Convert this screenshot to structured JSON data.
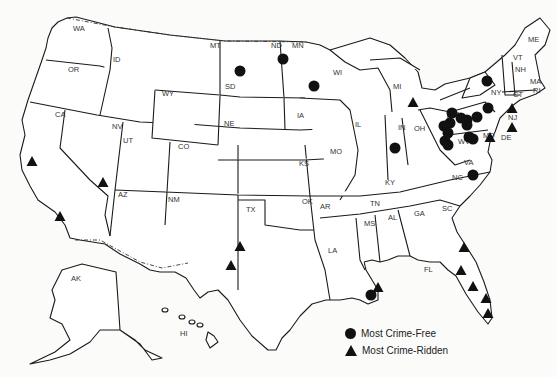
{
  "map": {
    "title": "",
    "state_labels": [
      {
        "code": "WA",
        "x": 73,
        "y": 31
      },
      {
        "code": "OR",
        "x": 68,
        "y": 72
      },
      {
        "code": "ID",
        "x": 113,
        "y": 62
      },
      {
        "code": "MT",
        "x": 210,
        "y": 48
      },
      {
        "code": "ND",
        "x": 271,
        "y": 48
      },
      {
        "code": "MN",
        "x": 292,
        "y": 48
      },
      {
        "code": "SD",
        "x": 225,
        "y": 89
      },
      {
        "code": "WY",
        "x": 162,
        "y": 96
      },
      {
        "code": "NE",
        "x": 224,
        "y": 126
      },
      {
        "code": "IA",
        "x": 297,
        "y": 118
      },
      {
        "code": "WI",
        "x": 333,
        "y": 75
      },
      {
        "code": "MI",
        "x": 393,
        "y": 89
      },
      {
        "code": "IL",
        "x": 355,
        "y": 127
      },
      {
        "code": "IN",
        "x": 398,
        "y": 130
      },
      {
        "code": "OH",
        "x": 414,
        "y": 131
      },
      {
        "code": "NY",
        "x": 491,
        "y": 95
      },
      {
        "code": "PA",
        "x": 451,
        "y": 117
      },
      {
        "code": "NJ",
        "x": 508,
        "y": 120
      },
      {
        "code": "MD",
        "x": 483,
        "y": 138
      },
      {
        "code": "DE",
        "x": 501,
        "y": 140
      },
      {
        "code": "WV",
        "x": 458,
        "y": 144
      },
      {
        "code": "VA",
        "x": 464,
        "y": 165
      },
      {
        "code": "KY",
        "x": 385,
        "y": 185
      },
      {
        "code": "NC",
        "x": 452,
        "y": 180
      },
      {
        "code": "VT",
        "x": 513,
        "y": 60
      },
      {
        "code": "NH",
        "x": 515,
        "y": 72
      },
      {
        "code": "ME",
        "x": 528,
        "y": 42
      },
      {
        "code": "MA",
        "x": 530,
        "y": 84
      },
      {
        "code": "CT",
        "x": 513,
        "y": 97
      },
      {
        "code": "RI",
        "x": 533,
        "y": 93
      },
      {
        "code": "CA",
        "x": 55,
        "y": 117
      },
      {
        "code": "NV",
        "x": 112,
        "y": 129
      },
      {
        "code": "UT",
        "x": 123,
        "y": 143
      },
      {
        "code": "CO",
        "x": 178,
        "y": 149
      },
      {
        "code": "KS",
        "x": 299,
        "y": 166
      },
      {
        "code": "MO",
        "x": 330,
        "y": 154
      },
      {
        "code": "AZ",
        "x": 118,
        "y": 197
      },
      {
        "code": "NM",
        "x": 168,
        "y": 202
      },
      {
        "code": "TX",
        "x": 246,
        "y": 212
      },
      {
        "code": "OK",
        "x": 302,
        "y": 204
      },
      {
        "code": "AR",
        "x": 320,
        "y": 209
      },
      {
        "code": "TN",
        "x": 370,
        "y": 206
      },
      {
        "code": "MS",
        "x": 364,
        "y": 226
      },
      {
        "code": "AL",
        "x": 388,
        "y": 220
      },
      {
        "code": "GA",
        "x": 414,
        "y": 216
      },
      {
        "code": "SC",
        "x": 442,
        "y": 211
      },
      {
        "code": "LA",
        "x": 328,
        "y": 253
      },
      {
        "code": "FL",
        "x": 424,
        "y": 272
      },
      {
        "code": "AK",
        "x": 71,
        "y": 281
      },
      {
        "code": "HI",
        "x": 180,
        "y": 336
      }
    ],
    "markers_crime_free": [
      {
        "x": 240,
        "y": 71
      },
      {
        "x": 283,
        "y": 59
      },
      {
        "x": 314,
        "y": 86
      },
      {
        "x": 395,
        "y": 148
      },
      {
        "x": 487,
        "y": 81
      },
      {
        "x": 488,
        "y": 108
      },
      {
        "x": 477,
        "y": 117
      },
      {
        "x": 467,
        "y": 120
      },
      {
        "x": 467,
        "y": 125
      },
      {
        "x": 461,
        "y": 118
      },
      {
        "x": 452,
        "y": 113
      },
      {
        "x": 450,
        "y": 123
      },
      {
        "x": 444,
        "y": 126
      },
      {
        "x": 448,
        "y": 133
      },
      {
        "x": 445,
        "y": 141
      },
      {
        "x": 448,
        "y": 145
      },
      {
        "x": 469,
        "y": 137
      },
      {
        "x": 473,
        "y": 139
      },
      {
        "x": 473,
        "y": 175
      },
      {
        "x": 371,
        "y": 295
      }
    ],
    "markers_crime_ridden": [
      {
        "x": 32,
        "y": 161
      },
      {
        "x": 103,
        "y": 182
      },
      {
        "x": 60,
        "y": 216
      },
      {
        "x": 240,
        "y": 246
      },
      {
        "x": 231,
        "y": 265
      },
      {
        "x": 413,
        "y": 102
      },
      {
        "x": 512,
        "y": 108
      },
      {
        "x": 512,
        "y": 127
      },
      {
        "x": 490,
        "y": 137
      },
      {
        "x": 378,
        "y": 287
      },
      {
        "x": 464,
        "y": 247
      },
      {
        "x": 461,
        "y": 270
      },
      {
        "x": 473,
        "y": 286
      },
      {
        "x": 486,
        "y": 298
      },
      {
        "x": 488,
        "y": 313
      }
    ]
  },
  "legend": {
    "items": [
      {
        "symbol": "circle",
        "label": "Most Crime-Free"
      },
      {
        "symbol": "triangle",
        "label": "Most Crime-Ridden"
      }
    ]
  }
}
